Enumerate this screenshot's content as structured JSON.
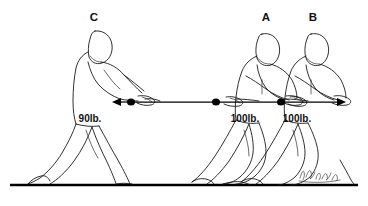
{
  "diagram": {
    "background_color": "#ffffff",
    "ink_color": "#1a1a1a",
    "ground_line_color": "#000000",
    "signature": "J. Fredrick"
  },
  "people": [
    {
      "id": "person-c",
      "label": "C",
      "label_x": 94,
      "label_y": 21,
      "force_label": "90lb.",
      "force_value": 90,
      "force_unit": "lb.",
      "force_label_x": 90,
      "force_label_y": 122,
      "pull_direction": "left",
      "facing": "right"
    },
    {
      "id": "person-a",
      "label": "A",
      "label_x": 266,
      "label_y": 21,
      "force_label": "100lb.",
      "force_value": 100,
      "force_unit": "lb.",
      "force_label_x": 245,
      "force_label_y": 122,
      "pull_direction": "right",
      "facing": "right"
    },
    {
      "id": "person-b",
      "label": "B",
      "label_x": 313,
      "label_y": 21,
      "force_label": "100lb.",
      "force_value": 100,
      "force_unit": "lb.",
      "force_label_x": 297,
      "force_label_y": 122,
      "pull_direction": "right",
      "facing": "right"
    }
  ],
  "rope": {
    "y": 102,
    "left_knot_x": 131,
    "mid_knot_x": 216,
    "right_knot_x": 281,
    "left_arrow_tip_x": 112,
    "right_arrow_tip_x": 346
  },
  "ground": {
    "y": 185,
    "x_start": 10,
    "x_end": 358
  }
}
